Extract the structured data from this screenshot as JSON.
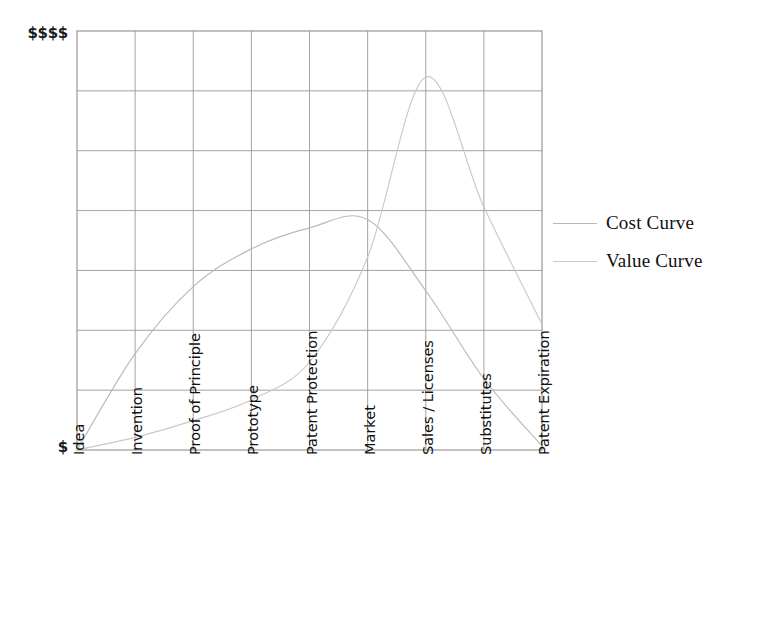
{
  "chart_data": {
    "type": "line",
    "title": "",
    "xlabel": "",
    "ylabel": "",
    "grid": true,
    "legend_position": "right",
    "y_axis": {
      "max_label": "$$$$",
      "min_label": "$",
      "ylim": [
        0,
        100
      ],
      "gridline_count": 8,
      "row_count": 7
    },
    "x_axis": {
      "categories": [
        "Idea",
        "Invention",
        "Proof of Principle",
        "Prototype",
        "Patent Protection",
        "Market",
        "Sales / Licenses",
        "Substitutes",
        "Patent Expiration"
      ],
      "label_rotation_deg": -90,
      "gridline_count": 9
    },
    "series": [
      {
        "name": "Cost Curve",
        "color": "#b9b9b9",
        "values": [
          0,
          23,
          39,
          48,
          53,
          55,
          38,
          17,
          1
        ],
        "peak_category": "Market",
        "peak_value": 55
      },
      {
        "name": "Value Curve",
        "color": "#c9c9c9",
        "values": [
          0,
          3,
          7,
          12,
          21,
          46,
          89,
          58,
          30
        ],
        "peak_category": "Sales / Licenses",
        "peak_value": 89
      }
    ]
  },
  "legend": {
    "items": [
      {
        "label": "Cost Curve",
        "color": "#b9b9b9"
      },
      {
        "label": "Value Curve",
        "color": "#c9c9c9"
      }
    ]
  },
  "colors": {
    "background": "#ffffff",
    "grid": "#9a9a9a",
    "frame": "#8f8f8f",
    "text": "#111111",
    "cost_curve": "#b9b9b9",
    "value_curve": "#c9c9c9"
  }
}
